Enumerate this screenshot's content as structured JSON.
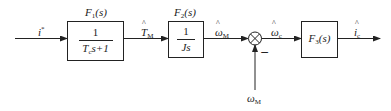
{
  "diagram": {
    "type": "control-block-diagram",
    "input": {
      "symbol": "i",
      "superscript": "*"
    },
    "blocks": [
      {
        "id": "F1",
        "name": "F",
        "subscript": "1",
        "arg": "(s)",
        "tf_numerator": "1",
        "tf_denominator_symbol": "T",
        "tf_denominator_sub": "c",
        "tf_denominator_rest": "s+1"
      },
      {
        "id": "F2",
        "name": "F",
        "subscript": "2",
        "arg": "(s)",
        "tf_numerator": "1",
        "tf_denominator": "Js"
      },
      {
        "id": "F3",
        "name": "F",
        "subscript": "3",
        "arg": "(s)"
      }
    ],
    "signals": {
      "torque_est": {
        "symbol": "T",
        "subscript": "M",
        "hat": true
      },
      "omega_m_est": {
        "symbol": "ω",
        "subscript": "M",
        "hat": true
      },
      "omega_c_est": {
        "symbol": "ω",
        "subscript": "c",
        "hat": true
      },
      "current_est": {
        "symbol": "i",
        "subscript": "c",
        "hat": true
      },
      "omega_m_meas": {
        "symbol": "ω",
        "subscript": "M",
        "hat": false
      }
    },
    "summing_junction": {
      "feedback_sign": "−"
    }
  }
}
